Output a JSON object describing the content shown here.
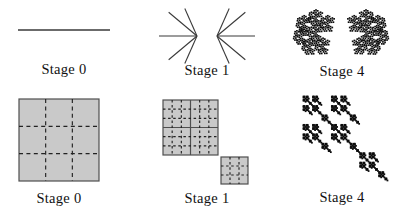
{
  "panels": [
    {
      "id": "top-left",
      "label": "Stage 0",
      "figure": "line-segment"
    },
    {
      "id": "top-middle",
      "label": "Stage 1",
      "figure": "double-fan-of-rays"
    },
    {
      "id": "top-right",
      "label": "Stage 4",
      "figure": "two-rosette-fractals"
    },
    {
      "id": "bottom-left",
      "label": "Stage 0",
      "figure": "shaded-square-dashed-3x3"
    },
    {
      "id": "bottom-middle",
      "label": "Stage 1",
      "figure": "four-squares-plus-corner-square"
    },
    {
      "id": "bottom-right",
      "label": "Stage 4",
      "figure": "diagonal-square-cluster-fractal"
    }
  ],
  "colors": {
    "background": "#ffffff",
    "ink": "#111111",
    "line": "#3a3a3a",
    "square_fill": "#c9c9c9",
    "square_border": "#4f4f4f",
    "dash": "#222222",
    "fractal": "#0d0d0d"
  },
  "figures": {
    "line": {
      "x1": 18,
      "y1": 30,
      "x2": 110,
      "y2": 30
    },
    "fans": [
      {
        "vertex": [
          197,
          36
        ],
        "rays": [
          [
            180,
            38
          ],
          [
            140,
            37
          ],
          [
            114,
            30
          ],
          [
            220,
            37
          ],
          [
            246,
            30
          ]
        ]
      },
      {
        "vertex": [
          217,
          36
        ],
        "rays": [
          [
            0,
            38
          ],
          [
            40,
            37
          ],
          [
            66,
            30
          ],
          [
            320,
            37
          ],
          [
            294,
            30
          ]
        ]
      }
    ],
    "rosettes": {
      "centers": [
        [
          316,
          33
        ],
        [
          366,
          33
        ]
      ],
      "mirror": [
        false,
        true
      ],
      "radius": 15,
      "shrink": 2.6,
      "depth": 3,
      "dot": 1.7,
      "ring_angles": [
        90,
        38,
        142,
        194,
        246,
        298
      ]
    },
    "grid_squares": [
      {
        "group": "stage0-square-figure",
        "x": 19,
        "y": 99,
        "w": 80,
        "h": 82,
        "solid_div": 1,
        "dash_div": 3,
        "dash": [
          4,
          3.4
        ]
      },
      {
        "group": "stage1-squares-figure",
        "x": 163,
        "y": 100,
        "w": 55,
        "h": 55,
        "solid_div": 2,
        "dash_div": 6,
        "dash": [
          2.5,
          2.6
        ]
      },
      {
        "group": "stage1-squares-figure",
        "x": 221,
        "y": 157,
        "w": 27,
        "h": 27,
        "solid_div": 1,
        "dash_div": 3,
        "dash": [
          2.5,
          2.6
        ]
      }
    ],
    "squares_ifs": {
      "origin": [
        303,
        96
      ],
      "size": 85,
      "depth": 4,
      "offsets": [
        [
          0,
          0
        ],
        [
          1,
          0
        ],
        [
          0,
          1
        ],
        [
          1,
          1
        ],
        [
          2,
          2
        ]
      ],
      "inflate": 1.7
    }
  }
}
